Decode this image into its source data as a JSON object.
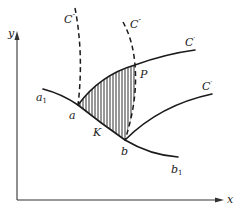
{
  "diagram": {
    "axes": {
      "x_label": "x",
      "y_label": "y"
    },
    "curves": {
      "c_prime_upper": {
        "label": "C",
        "mark": "′"
      },
      "c_prime_lower": {
        "label": "C",
        "mark": "′"
      },
      "c_double_left": {
        "label": "C",
        "mark": "″"
      },
      "c_double_right": {
        "label": "C",
        "mark": "″"
      },
      "initial_curve": {
        "start_label": "a",
        "start_sub": "1",
        "end_label": "b",
        "end_sub": "1"
      }
    },
    "points": {
      "a": "a",
      "b": "b",
      "P": "P",
      "K": "K"
    },
    "shaded_region": {
      "description": "hatched region bounded by a, P, b",
      "color": "#1a1a1a"
    }
  }
}
